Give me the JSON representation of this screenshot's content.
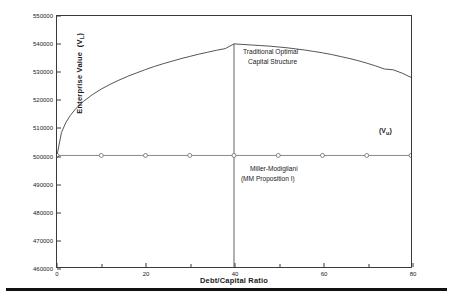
{
  "chart_data": {
    "type": "line",
    "title": "",
    "xlabel": "Debt/Capital Ratio",
    "ylabel": "Enterprise Value  (V)",
    "ylabel_sub": "L",
    "xlim": [
      0,
      80
    ],
    "ylim": [
      460000,
      550000
    ],
    "x_ticks": [
      0,
      20,
      40,
      60,
      80
    ],
    "x_ticks_minor": [
      10,
      30,
      50,
      70
    ],
    "y_ticks": [
      460000,
      470000,
      480000,
      490000,
      500000,
      510000,
      520000,
      530000,
      540000,
      550000
    ],
    "x_tick_labels": [
      "0",
      "20",
      "40",
      "60",
      "80"
    ],
    "y_tick_labels": [
      "460000",
      "470000",
      "480000",
      "490000",
      "500000",
      "510000",
      "520000",
      "530000",
      "540000",
      "550000"
    ],
    "grid": false,
    "legend": "none",
    "series": [
      {
        "name": "Traditional Optimal Capital Structure",
        "marker": "none",
        "x": [
          0,
          1,
          2,
          3,
          4,
          5,
          6,
          8,
          10,
          12,
          14,
          16,
          18,
          20,
          22,
          24,
          26,
          28,
          30,
          32,
          34,
          36,
          38,
          40,
          42,
          44,
          46,
          48,
          50,
          52,
          54,
          56,
          58,
          60,
          62,
          64,
          66,
          68,
          70,
          72,
          74,
          76,
          78,
          80
        ],
        "values": [
          500000,
          508200,
          511800,
          514300,
          516300,
          518000,
          519400,
          521800,
          523800,
          525500,
          527000,
          528400,
          529600,
          530800,
          531900,
          532900,
          533800,
          534700,
          535500,
          536300,
          537000,
          537700,
          538300,
          540000,
          539800,
          539600,
          539400,
          539200,
          538900,
          538600,
          538200,
          537800,
          537300,
          536800,
          536200,
          535500,
          534800,
          534000,
          533100,
          532100,
          531000,
          530700,
          529500,
          528000
        ]
      },
      {
        "name": "Miller-Modigliani (MM Proposition I)",
        "marker": "circle",
        "x": [
          0,
          10,
          20,
          30,
          40,
          50,
          60,
          70,
          80
        ],
        "values": [
          500000,
          500000,
          500000,
          500000,
          500000,
          500000,
          500000,
          500000,
          500000
        ]
      }
    ],
    "reference_line": {
      "name": "optimal-capital-structure-line",
      "x": 40,
      "y_from": 460000,
      "y_to": 540000
    },
    "annotations": [
      {
        "name": "traditional-optimal",
        "lines": [
          "Traditional Optimal",
          "Capital Structure"
        ],
        "x": 41,
        "y": 536000
      },
      {
        "name": "miller-modigliani",
        "lines": [
          "Miller-Modigliani",
          "(MM Proposition I)"
        ],
        "x": 41,
        "y": 494000
      },
      {
        "name": "unlevered-value",
        "text": "(V",
        "sub": "u",
        "text_end": ")",
        "x": 70,
        "y": 503000
      }
    ]
  },
  "axes": {
    "y_title_main": "Enterprise Value",
    "y_title_paren_open": "(V",
    "y_title_sub": "L",
    "y_title_paren_close": ")",
    "x_title": "Debt/Capital Ratio"
  },
  "annotations_text": {
    "traditional_line1": "Traditional Optimal",
    "traditional_line2": "Capital Structure",
    "mm_line1": "Miller-Modigliani",
    "mm_line2": "(MM Proposition I)",
    "vu_open": "(V",
    "vu_sub": "u",
    "vu_close": ")"
  },
  "colors": {
    "curve": "#404040",
    "mm_line": "#6a6a6a",
    "axis": "#3a3a3a",
    "text": "#1a1a1a",
    "footer_rule": "#111111"
  }
}
